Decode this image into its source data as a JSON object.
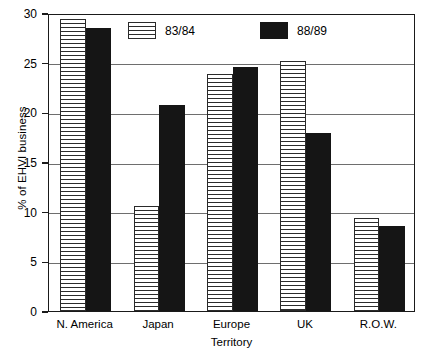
{
  "chart_data": {
    "type": "bar",
    "title": "",
    "xlabel": "Territory",
    "ylabel": "% of EHVI business",
    "categories": [
      "N. America",
      "Japan",
      "Europe",
      "UK",
      "R.O.W."
    ],
    "series": [
      {
        "name": "83/84",
        "values": [
          29.4,
          10.6,
          23.9,
          25.2,
          9.4
        ],
        "fill": "horizontal-stripes",
        "color": "#2b2b2b"
      },
      {
        "name": "88/89",
        "values": [
          28.5,
          20.7,
          24.6,
          17.9,
          8.6
        ],
        "fill": "solid",
        "color": "#151515"
      }
    ],
    "ylim": [
      0,
      30
    ],
    "yticks": [
      0,
      5,
      10,
      15,
      20,
      25,
      30
    ],
    "ytick_labels": [
      "0",
      "5",
      "10",
      "15",
      "20",
      "25",
      "30"
    ],
    "grid": "horizontal",
    "legend_position": "inside-top-center"
  },
  "legend": {
    "items": [
      {
        "label": "83/84",
        "swatch": "horizontal-stripes"
      },
      {
        "label": "88/89",
        "swatch": "solid-black"
      }
    ]
  }
}
